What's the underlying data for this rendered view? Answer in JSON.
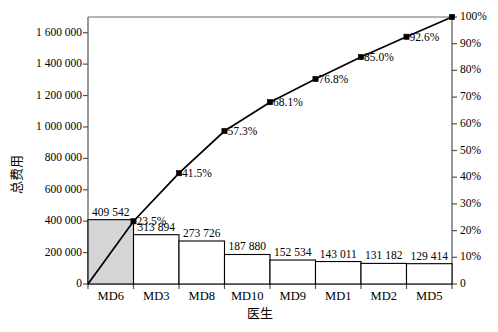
{
  "chart_data": {
    "type": "bar",
    "title": "",
    "subtitle": "",
    "xlabel": "医生",
    "ylabel": "总费用",
    "y2label": "",
    "categories": [
      "MD6",
      "MD3",
      "MD8",
      "MD10",
      "MD9",
      "MD1",
      "MD2",
      "MD5"
    ],
    "values": [
      409542,
      313894,
      273726,
      187880,
      152534,
      143011,
      131182,
      129414
    ],
    "value_labels": [
      "409 542",
      "313 894",
      "273 726",
      "187 880",
      "152 534",
      "143 011",
      "131 182",
      "129 414"
    ],
    "cumulative_percent": [
      23.5,
      41.5,
      57.3,
      68.1,
      76.8,
      85.0,
      92.6,
      100.0
    ],
    "cumulative_percent_labels": [
      "23.5%",
      "41.5%",
      "57.3%",
      "68.1%",
      "76.8%",
      "85.0%",
      "92.6%",
      ""
    ],
    "ylim": [
      0,
      1700000
    ],
    "y2lim": [
      0,
      100
    ],
    "yticks": [
      0,
      200000,
      400000,
      600000,
      800000,
      1000000,
      1200000,
      1400000,
      1600000
    ],
    "ytick_labels": [
      "0",
      "200 000",
      "400 000",
      "600 000",
      "800 000",
      "1 000 000",
      "1 200 000",
      "1 400 000",
      "1 600 000"
    ],
    "y2ticks": [
      0,
      10,
      20,
      30,
      40,
      50,
      60,
      70,
      80,
      90,
      100
    ],
    "y2tick_labels": [
      "0",
      "10%",
      "20%",
      "30%",
      "40%",
      "50%",
      "60%",
      "70%",
      "80%",
      "90%",
      "100%"
    ],
    "grid": false,
    "legend": "none",
    "highlighted_category": "MD6",
    "colors": {
      "bar_fill": "#ffffff",
      "bar_highlight_fill": "#d5d5d5",
      "bar_stroke": "#000000",
      "line": "#000000",
      "marker": "#000000",
      "axis": "#555555",
      "text": "#000000"
    }
  }
}
